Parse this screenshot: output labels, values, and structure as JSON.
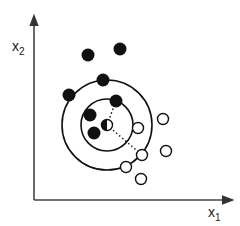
{
  "diagram": {
    "type": "knn-scatter",
    "axes": {
      "x_label": "x",
      "x_sub": "1",
      "y_label": "x",
      "y_sub": "2"
    },
    "query_point": {
      "x": 107,
      "y": 125,
      "style": "half-filled"
    },
    "circles": [
      {
        "name": "inner-neighborhood",
        "r": 26
      },
      {
        "name": "outer-neighborhood",
        "r": 45
      }
    ],
    "class_a_filled": [
      [
        88,
        55
      ],
      [
        120,
        49
      ],
      [
        103,
        80
      ],
      [
        69,
        95
      ],
      [
        116,
        101
      ],
      [
        90,
        115
      ],
      [
        94,
        133
      ]
    ],
    "class_b_hollow": [
      [
        138,
        128
      ],
      [
        163,
        119
      ],
      [
        142,
        155
      ],
      [
        166,
        151
      ],
      [
        126,
        167
      ],
      [
        141,
        179
      ]
    ],
    "dotted_lines": [
      {
        "from": [
          107,
          125
        ],
        "to": [
          116,
          101
        ]
      },
      {
        "from": [
          107,
          125
        ],
        "to": [
          142,
          155
        ]
      }
    ],
    "colors": {
      "ink": "#111111",
      "axis": "#444444",
      "background": "#ffffff"
    }
  }
}
